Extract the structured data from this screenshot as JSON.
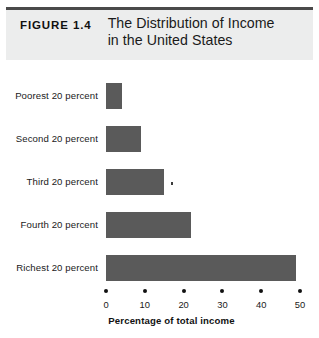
{
  "header": {
    "figure_label": "FIGURE 1.4",
    "title_line_1": "The Distribution of Income",
    "title_line_2": "in the United States",
    "band_color": "#eceded",
    "rule_color": "#4a4a4a"
  },
  "chart_data": {
    "type": "bar",
    "orientation": "horizontal",
    "title": "The Distribution of Income in the United States",
    "subtitle": "",
    "categories": [
      "Poorest 20 percent",
      "Second 20 percent",
      "Third 20 percent",
      "Fourth 20 percent",
      "Richest 20 percent"
    ],
    "values": [
      4,
      9,
      15,
      22,
      49
    ],
    "xlabel": "Percentage of total income",
    "ylabel": "",
    "xlim": [
      0,
      50
    ],
    "xticks": [
      0,
      10,
      20,
      30,
      40,
      50
    ],
    "xtick_labels": [
      "0",
      "10",
      "20",
      "30",
      "40",
      "50"
    ],
    "grid": false,
    "legend": false,
    "bar_color": "#5a5a5a",
    "background": "#ffffff"
  }
}
